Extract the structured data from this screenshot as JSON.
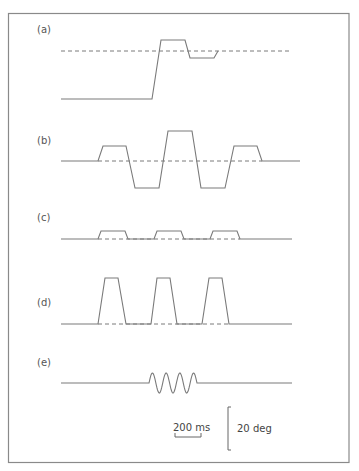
{
  "figure": {
    "panels": [
      {
        "id": "a",
        "label": "(a)",
        "description": "step with overshoot and undershoot settling to target"
      },
      {
        "id": "b",
        "label": "(b)",
        "description": "alternating large and small trapezoidal oscillations around reference"
      },
      {
        "id": "c",
        "label": "(c)",
        "description": "three small trapezoidal pulses"
      },
      {
        "id": "d",
        "label": "(d)",
        "description": "three tall trapezoidal pulses"
      },
      {
        "id": "e",
        "label": "(e)",
        "description": "short sinusoidal burst"
      }
    ],
    "scale_bars": {
      "time_label": "200 ms",
      "angle_label": "20 deg"
    }
  }
}
